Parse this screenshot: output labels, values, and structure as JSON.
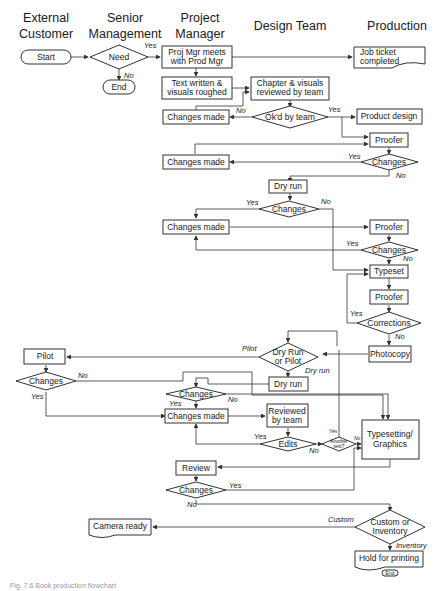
{
  "lanes": [
    "External Customer",
    "Senior Management",
    "Project Manager",
    "Design Team",
    "Production"
  ],
  "lane_lines": {
    "external": [
      "External",
      "Customer"
    ],
    "senior": [
      "Senior",
      "Management"
    ],
    "pm": [
      "Project",
      "Manager"
    ],
    "design": "Design Team",
    "production": "Production"
  },
  "nodes": {
    "start": "Start",
    "need": "Need",
    "end": "End",
    "pm_meets": [
      "Proj Mgr meets",
      "with Prod Mgr"
    ],
    "job_ticket": [
      "Job ticket",
      "completed"
    ],
    "text_written": [
      "Text written &",
      "visuals roughed"
    ],
    "chapter_review": [
      "Chapter & visuals",
      "reviewed by team"
    ],
    "changes_made_1": "Changes made",
    "okd": "Ok'd by team",
    "product_design": "Product design",
    "proofer_1": "Proofer",
    "changes_made_2": "Changes made",
    "changes_1": "Changes",
    "dry_run_1": "Dry run",
    "changes_2": "Changes",
    "changes_made_3": "Changes made",
    "proofer_2": "Proofer",
    "changes_3": "Changes",
    "typeset": "Typeset",
    "proofer_3": "Proofer",
    "corrections": "Corrections",
    "photocopy": "Photocopy",
    "dry_run_or_pilot": [
      "Dry Run",
      "or Pilot"
    ],
    "pilot": "Pilot",
    "changes_4": "Changes",
    "dry_run_2": "Dry run",
    "changes_5": "Changes",
    "changes_made_4": "Changes made",
    "reviewed_by_team": [
      "Reviewed",
      "by team"
    ],
    "edits": "Edits",
    "another_test": [
      "Another",
      "test?"
    ],
    "typesetting_graphics": [
      "Typesetting/",
      "Graphics"
    ],
    "review": "Review",
    "changes_6": "Changes",
    "custom_or_inventory": [
      "Custom or",
      "Inventory"
    ],
    "camera_ready": "Camera ready",
    "hold_for_printing": "Hold for printing",
    "end_small": "End"
  },
  "labels": {
    "yes": "Yes",
    "no": "No",
    "pilot": "Pilot",
    "dry_run": "Dry run",
    "custom": "Custom",
    "inventory": "Inventory"
  },
  "caption": "Fig. 7.6  Book production flowchart"
}
